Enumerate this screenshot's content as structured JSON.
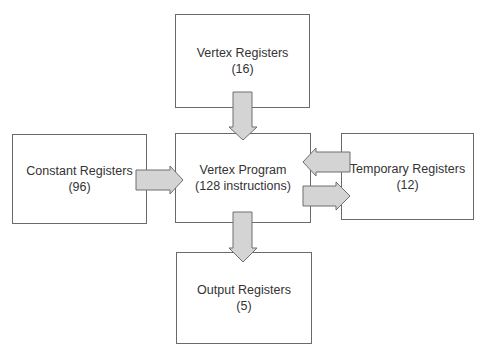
{
  "diagram": {
    "nodes": [
      {
        "id": "vertex_registers",
        "label": "Vertex Registers",
        "count": "(16)"
      },
      {
        "id": "constant_registers",
        "label": "Constant Registers",
        "count": "(96)"
      },
      {
        "id": "vertex_program",
        "label": "Vertex Program",
        "count": "(128 instructions)"
      },
      {
        "id": "temporary_registers",
        "label": "Temporary Registers",
        "count": "(12)"
      },
      {
        "id": "output_registers",
        "label": "Output Registers",
        "count": "(5)"
      }
    ],
    "edges": [
      {
        "from": "vertex_registers",
        "to": "vertex_program"
      },
      {
        "from": "constant_registers",
        "to": "vertex_program"
      },
      {
        "from": "temporary_registers",
        "to": "vertex_program"
      },
      {
        "from": "vertex_program",
        "to": "temporary_registers"
      },
      {
        "from": "vertex_program",
        "to": "output_registers"
      }
    ],
    "colors": {
      "arrow_fill": "#d4d4d4",
      "arrow_stroke": "#6e6e6e",
      "box_border": "#6a6a6a",
      "text": "#333333"
    }
  }
}
